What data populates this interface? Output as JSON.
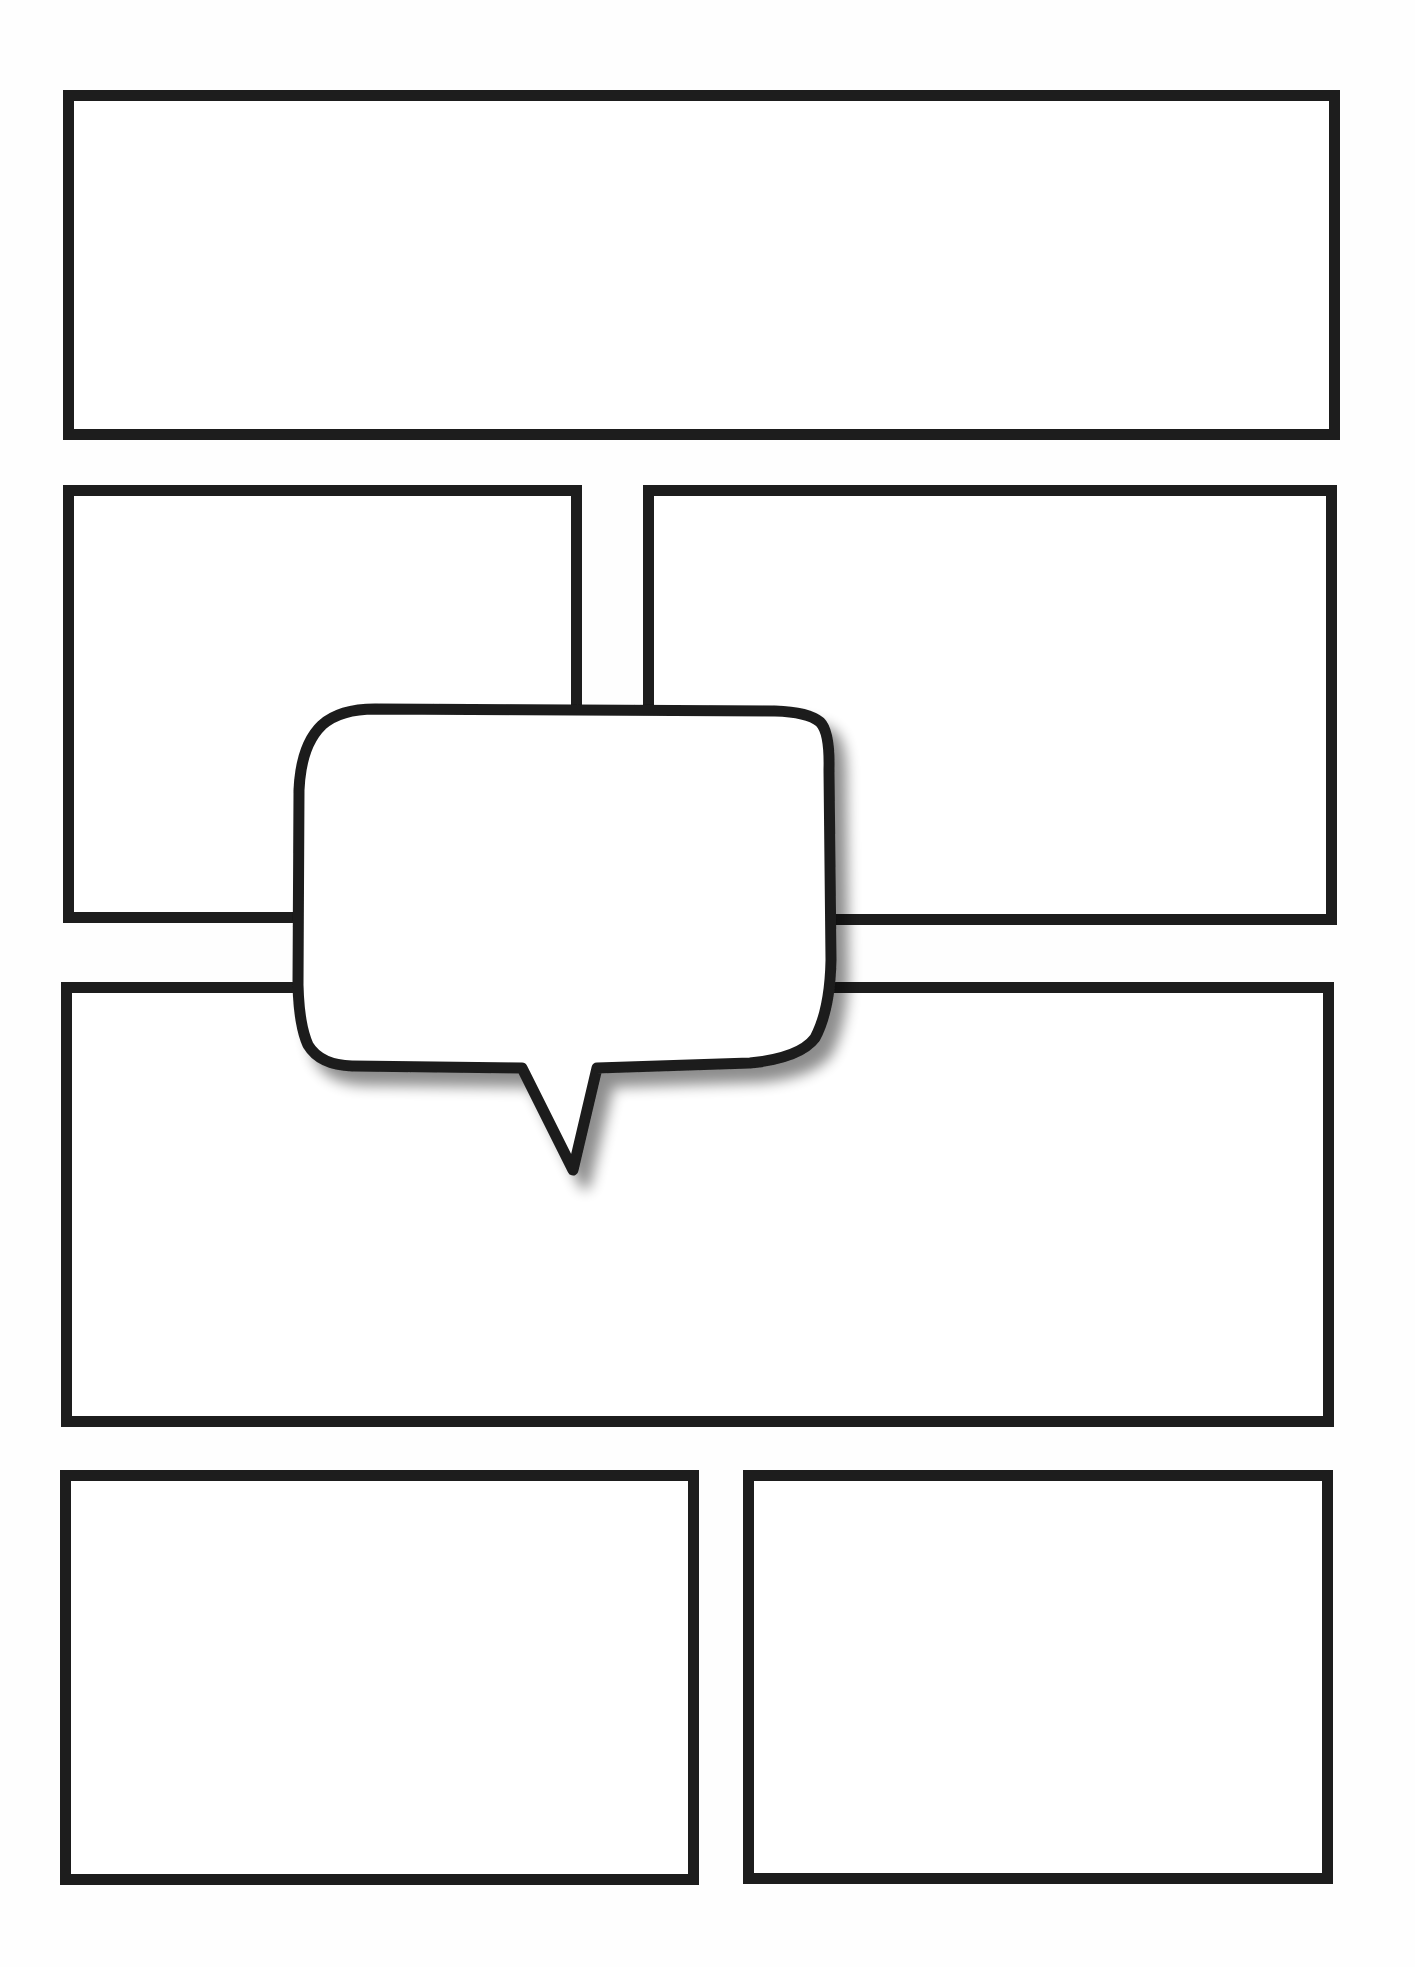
{
  "page": {
    "type": "comic-page-template",
    "background": "#ffffff",
    "stroke_color": "#1d1d1d",
    "stroke_width": 11
  },
  "panels": [
    {
      "id": "panel-1",
      "x": 63,
      "y": 90,
      "w": 1277,
      "h": 350
    },
    {
      "id": "panel-2",
      "x": 63,
      "y": 485,
      "w": 519,
      "h": 438
    },
    {
      "id": "panel-3",
      "x": 643,
      "y": 485,
      "w": 694,
      "h": 440
    },
    {
      "id": "panel-4",
      "x": 61,
      "y": 982,
      "w": 1273,
      "h": 445
    },
    {
      "id": "panel-5",
      "x": 60,
      "y": 1470,
      "w": 639,
      "h": 415
    },
    {
      "id": "panel-6",
      "x": 743,
      "y": 1470,
      "w": 590,
      "h": 414
    }
  ],
  "speech_bubble": {
    "text": "",
    "tail_direction": "down",
    "shadow": true
  }
}
